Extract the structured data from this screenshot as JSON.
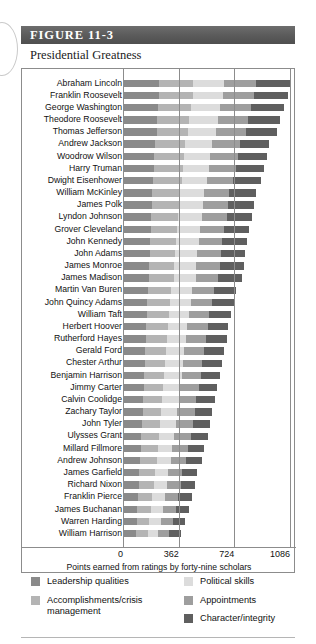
{
  "figure": {
    "header_label": "FIGURE 11-3",
    "subtitle": "Presidential Greatness"
  },
  "chart_data": {
    "type": "bar",
    "orientation": "horizontal",
    "stacked": true,
    "title": "Presidential Greatness",
    "xlabel": "Points earned from ratings by forty-nine scholars",
    "ylabel": "",
    "xlim": [
      0,
      1086
    ],
    "ticks": [
      0,
      362,
      724,
      1086
    ],
    "tick_labels": [
      "0",
      "362",
      "724",
      "1086"
    ],
    "grid": true,
    "legend_position": "bottom",
    "series": [
      {
        "name": "Leadership qualities",
        "color": "#8a8a8a"
      },
      {
        "name": "Accomplishments/crisis management",
        "color": "#b4b4b4"
      },
      {
        "name": "Political skills",
        "color": "#dcdcdc"
      },
      {
        "name": "Appointments",
        "color": "#9e9e9e"
      },
      {
        "name": "Character/integrity",
        "color": "#5f5f5f"
      }
    ],
    "categories": [
      "Abraham Lincoln",
      "Franklin Roosevelt",
      "George Washington",
      "Theodore Roosevelt",
      "Thomas Jefferson",
      "Andrew Jackson",
      "Woodrow Wilson",
      "Harry Truman",
      "Dwight Eisenhower",
      "William McKinley",
      "James Polk",
      "Lyndon Johnson",
      "Grover Cleveland",
      "John Kennedy",
      "John Adams",
      "James Monroe",
      "James Madison",
      "Martin Van Buren",
      "John Quincy Adams",
      "William Taft",
      "Herbert Hoover",
      "Rutherford Hayes",
      "Gerald Ford",
      "Chester Arthur",
      "Benjamin Harrison",
      "Jimmy Carter",
      "Calvin Coolidge",
      "Zachary Taylor",
      "John Tyler",
      "Ulysses Grant",
      "Millard Fillmore",
      "Andrew Johnson",
      "James Garfield",
      "Richard Nixon",
      "Franklin Pierce",
      "James Buchanan",
      "Warren Harding",
      "William Harrison"
    ],
    "values": [
      [
        236,
        222,
        200,
        208,
        224
      ],
      [
        232,
        220,
        196,
        204,
        218
      ],
      [
        228,
        214,
        192,
        200,
        216
      ],
      [
        222,
        210,
        188,
        196,
        208
      ],
      [
        218,
        206,
        184,
        192,
        204
      ],
      [
        206,
        196,
        174,
        182,
        190
      ],
      [
        204,
        192,
        172,
        180,
        188
      ],
      [
        200,
        190,
        168,
        176,
        184
      ],
      [
        196,
        186,
        164,
        172,
        180
      ],
      [
        188,
        178,
        158,
        166,
        172
      ],
      [
        186,
        176,
        156,
        164,
        170
      ],
      [
        184,
        174,
        154,
        162,
        166
      ],
      [
        180,
        170,
        150,
        158,
        164
      ],
      [
        176,
        168,
        148,
        154,
        160
      ],
      [
        174,
        164,
        146,
        152,
        158
      ],
      [
        172,
        162,
        144,
        150,
        156
      ],
      [
        170,
        160,
        142,
        148,
        154
      ],
      [
        162,
        152,
        136,
        142,
        146
      ],
      [
        158,
        150,
        132,
        138,
        144
      ],
      [
        154,
        146,
        128,
        134,
        140
      ],
      [
        150,
        142,
        126,
        132,
        136
      ],
      [
        148,
        140,
        124,
        130,
        134
      ],
      [
        144,
        136,
        120,
        126,
        130
      ],
      [
        140,
        132,
        118,
        124,
        128
      ],
      [
        138,
        130,
        116,
        122,
        126
      ],
      [
        134,
        128,
        112,
        118,
        122
      ],
      [
        130,
        124,
        110,
        114,
        118
      ],
      [
        128,
        120,
        106,
        112,
        116
      ],
      [
        124,
        118,
        104,
        108,
        112
      ],
      [
        120,
        114,
        100,
        106,
        110
      ],
      [
        116,
        110,
        96,
        102,
        106
      ],
      [
        112,
        106,
        94,
        98,
        102
      ],
      [
        106,
        100,
        88,
        92,
        96
      ],
      [
        102,
        98,
        86,
        90,
        92
      ],
      [
        98,
        92,
        82,
        86,
        90
      ],
      [
        94,
        90,
        78,
        82,
        86
      ],
      [
        88,
        84,
        74,
        78,
        80
      ],
      [
        82,
        78,
        68,
        72,
        76
      ]
    ]
  },
  "legend": {
    "columns": [
      [
        {
          "label": "Leadership qualities",
          "color": "#8a8a8a"
        },
        {
          "label": "Accomplishments/crisis management",
          "color": "#b4b4b4"
        }
      ],
      [
        {
          "label": "Political skills",
          "color": "#dcdcdc"
        },
        {
          "label": "Appointments",
          "color": "#9e9e9e"
        },
        {
          "label": "Character/integrity",
          "color": "#5f5f5f"
        }
      ]
    ]
  }
}
